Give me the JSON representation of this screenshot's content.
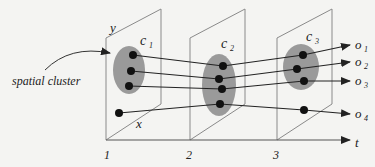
{
  "diagram": {
    "axis_label": "t",
    "plane_axis_labels": {
      "y": "y",
      "x": "x"
    },
    "time_ticks": [
      "1",
      "2",
      "3"
    ],
    "annotation": "spatial cluster",
    "clusters": [
      {
        "name": "c",
        "sub": "1"
      },
      {
        "name": "c",
        "sub": "2"
      },
      {
        "name": "c",
        "sub": "3"
      }
    ],
    "objects": [
      {
        "name": "o",
        "sub": "1"
      },
      {
        "name": "o",
        "sub": "2"
      },
      {
        "name": "o",
        "sub": "3"
      },
      {
        "name": "o",
        "sub": "4"
      }
    ],
    "colors": {
      "plane_edge": "#8a8a8a",
      "cluster_fill": "#9a9a9a",
      "point": "#111111",
      "line": "#222222"
    }
  }
}
